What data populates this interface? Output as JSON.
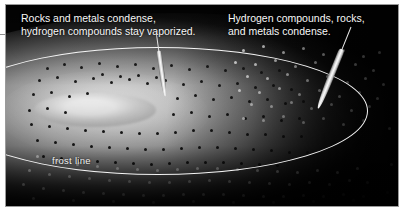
{
  "figure": {
    "type": "protoplanetary-disk-illustration",
    "background_color": "#050505",
    "frame_color": "#9a9a9a",
    "page_background": "#ffffff"
  },
  "annotations": {
    "left": {
      "text": "Rocks and metals condense,\nhydrogen compounds stay vaporized.",
      "color": "#f7f7f7",
      "pointer_target": "inner disk, inside frost line"
    },
    "right": {
      "text": "Hydrogen compounds, rocks,\nand metals condense.",
      "color": "#f7f7f7",
      "pointer_target": "outer disk, beyond frost line"
    }
  },
  "features": {
    "frost_line_label": "frost line",
    "frost_line_color": "#f4f4f4",
    "protosun_label": "protosun",
    "protosun_color": "#ffffff",
    "inner_particles": "dark rocky and metallic grains",
    "inner_particle_color": "#1b1b1b",
    "outer_particles": "bright icy condensate grains",
    "outer_particle_color": "#ffffff"
  },
  "chart_data": {
    "type": "scatter",
    "xlabel": "",
    "ylabel": "",
    "legend": [
      {
        "name": "Rocks and metals condense, hydrogen compounds stay vaporized.",
        "region": "inside frost line",
        "marker_color": "#1b1b1b"
      },
      {
        "name": "Hydrogen compounds, rocks, and metals condense.",
        "region": "outside frost line",
        "marker_color": "#ffffff"
      }
    ],
    "annotations": [
      "frost line"
    ],
    "grid": false
  },
  "particles": {
    "rock": [
      [
        40,
        62,
        3
      ],
      [
        57,
        58,
        3
      ],
      [
        74,
        61,
        3
      ],
      [
        92,
        57,
        3
      ],
      [
        110,
        60,
        3
      ],
      [
        128,
        58,
        3
      ],
      [
        146,
        62,
        3
      ],
      [
        164,
        59,
        3
      ],
      [
        182,
        63,
        3
      ],
      [
        200,
        60,
        3
      ],
      [
        218,
        64,
        3
      ],
      [
        236,
        62,
        3
      ],
      [
        254,
        66,
        3
      ],
      [
        272,
        64,
        3
      ],
      [
        32,
        74,
        3
      ],
      [
        50,
        71,
        3
      ],
      [
        68,
        75,
        3
      ],
      [
        86,
        72,
        3
      ],
      [
        104,
        76,
        3
      ],
      [
        122,
        73,
        3
      ],
      [
        140,
        77,
        3
      ],
      [
        158,
        74,
        3
      ],
      [
        176,
        78,
        3
      ],
      [
        194,
        75,
        3
      ],
      [
        212,
        79,
        3
      ],
      [
        230,
        77,
        3
      ],
      [
        248,
        81,
        3
      ],
      [
        266,
        79,
        3
      ],
      [
        284,
        83,
        3
      ],
      [
        26,
        88,
        3
      ],
      [
        44,
        86,
        3
      ],
      [
        62,
        90,
        3
      ],
      [
        80,
        87,
        3
      ],
      [
        170,
        92,
        3
      ],
      [
        188,
        89,
        3
      ],
      [
        206,
        93,
        3
      ],
      [
        224,
        91,
        3
      ],
      [
        242,
        95,
        3
      ],
      [
        260,
        93,
        3
      ],
      [
        278,
        97,
        3
      ],
      [
        296,
        95,
        3
      ],
      [
        22,
        104,
        3
      ],
      [
        40,
        102,
        3
      ],
      [
        58,
        106,
        3
      ],
      [
        166,
        108,
        3
      ],
      [
        184,
        106,
        3
      ],
      [
        202,
        110,
        3
      ],
      [
        220,
        108,
        3
      ],
      [
        238,
        112,
        3
      ],
      [
        256,
        110,
        3
      ],
      [
        274,
        114,
        3
      ],
      [
        292,
        112,
        3
      ],
      [
        24,
        118,
        3
      ],
      [
        42,
        120,
        3
      ],
      [
        60,
        122,
        3
      ],
      [
        78,
        124,
        3
      ],
      [
        96,
        125,
        3
      ],
      [
        114,
        126,
        3
      ],
      [
        132,
        127,
        3
      ],
      [
        150,
        127,
        3
      ],
      [
        168,
        126,
        3
      ],
      [
        186,
        124,
        3
      ],
      [
        204,
        124,
        3
      ],
      [
        222,
        126,
        3
      ],
      [
        240,
        128,
        3
      ],
      [
        258,
        128,
        3
      ],
      [
        276,
        130,
        3
      ],
      [
        294,
        130,
        3
      ],
      [
        30,
        134,
        3
      ],
      [
        48,
        136,
        3
      ],
      [
        66,
        138,
        3
      ],
      [
        84,
        140,
        3
      ],
      [
        102,
        141,
        3
      ],
      [
        120,
        142,
        3
      ],
      [
        138,
        143,
        3
      ],
      [
        156,
        143,
        3
      ],
      [
        174,
        142,
        3
      ],
      [
        192,
        141,
        3
      ],
      [
        210,
        141,
        3
      ],
      [
        228,
        142,
        3
      ],
      [
        246,
        143,
        3
      ],
      [
        264,
        144,
        3
      ],
      [
        282,
        146,
        3
      ],
      [
        300,
        146,
        3
      ],
      [
        36,
        150,
        3
      ],
      [
        54,
        152,
        3
      ],
      [
        72,
        154,
        3
      ],
      [
        90,
        155,
        3
      ],
      [
        108,
        156,
        3
      ],
      [
        126,
        157,
        3
      ],
      [
        144,
        158,
        3
      ],
      [
        162,
        157,
        3
      ],
      [
        180,
        156,
        3
      ],
      [
        198,
        156,
        3
      ],
      [
        216,
        156,
        3
      ],
      [
        234,
        157,
        3
      ],
      [
        252,
        158,
        3
      ],
      [
        270,
        159,
        3
      ],
      [
        95,
        68,
        3
      ],
      [
        113,
        70,
        3
      ],
      [
        131,
        69,
        3
      ],
      [
        149,
        71,
        3
      ]
    ],
    "ice": [
      [
        236,
        44,
        3
      ],
      [
        256,
        40,
        3
      ],
      [
        276,
        46,
        3
      ],
      [
        296,
        42,
        3
      ],
      [
        316,
        48,
        3
      ],
      [
        336,
        44,
        3
      ],
      [
        356,
        50,
        3
      ],
      [
        372,
        46,
        3
      ],
      [
        228,
        56,
        3
      ],
      [
        248,
        58,
        3
      ],
      [
        268,
        54,
        3
      ],
      [
        288,
        60,
        3
      ],
      [
        308,
        56,
        3
      ],
      [
        328,
        62,
        3
      ],
      [
        348,
        58,
        3
      ],
      [
        366,
        64,
        3
      ],
      [
        240,
        70,
        3
      ],
      [
        260,
        72,
        3
      ],
      [
        280,
        68,
        3
      ],
      [
        300,
        74,
        3
      ],
      [
        320,
        70,
        3
      ],
      [
        340,
        76,
        3
      ],
      [
        358,
        72,
        3
      ],
      [
        376,
        78,
        3
      ],
      [
        232,
        84,
        3
      ],
      [
        252,
        86,
        3
      ],
      [
        272,
        82,
        3
      ],
      [
        292,
        88,
        3
      ],
      [
        312,
        84,
        3
      ],
      [
        332,
        90,
        3
      ],
      [
        352,
        86,
        3
      ],
      [
        370,
        92,
        3
      ],
      [
        244,
        98,
        3
      ],
      [
        264,
        100,
        3
      ],
      [
        284,
        96,
        3
      ],
      [
        304,
        102,
        3
      ],
      [
        324,
        98,
        3
      ],
      [
        344,
        104,
        3
      ],
      [
        362,
        100,
        3
      ],
      [
        236,
        112,
        3
      ],
      [
        256,
        114,
        3
      ],
      [
        276,
        110,
        3
      ],
      [
        296,
        116,
        3
      ],
      [
        316,
        112,
        3
      ],
      [
        336,
        118,
        3
      ],
      [
        356,
        114,
        3
      ],
      [
        30,
        150,
        3
      ],
      [
        50,
        154,
        3
      ],
      [
        70,
        158,
        3
      ],
      [
        90,
        160,
        3
      ],
      [
        110,
        162,
        3
      ],
      [
        130,
        163,
        3
      ],
      [
        150,
        164,
        3
      ],
      [
        170,
        163,
        3
      ],
      [
        190,
        162,
        3
      ],
      [
        210,
        162,
        3
      ],
      [
        230,
        163,
        3
      ],
      [
        250,
        164,
        3
      ],
      [
        270,
        165,
        3
      ],
      [
        290,
        166,
        3
      ],
      [
        310,
        164,
        3
      ],
      [
        330,
        166,
        3
      ],
      [
        350,
        162,
        3
      ],
      [
        22,
        164,
        3
      ],
      [
        42,
        168,
        3
      ],
      [
        62,
        170,
        3
      ],
      [
        82,
        172,
        3
      ],
      [
        102,
        174,
        3
      ],
      [
        122,
        175,
        3
      ],
      [
        142,
        176,
        3
      ],
      [
        162,
        176,
        3
      ],
      [
        182,
        175,
        3
      ],
      [
        202,
        174,
        3
      ],
      [
        222,
        175,
        3
      ],
      [
        242,
        176,
        3
      ],
      [
        262,
        177,
        3
      ],
      [
        282,
        178,
        3
      ],
      [
        302,
        176,
        3
      ],
      [
        322,
        178,
        3
      ],
      [
        342,
        174,
        3
      ],
      [
        360,
        176,
        3
      ],
      [
        16,
        178,
        3
      ],
      [
        36,
        182,
        3
      ],
      [
        56,
        184,
        3
      ],
      [
        76,
        186,
        3
      ],
      [
        96,
        187,
        3
      ],
      [
        116,
        188,
        3
      ],
      [
        136,
        189,
        3
      ],
      [
        156,
        189,
        3
      ],
      [
        176,
        188,
        3
      ],
      [
        196,
        188,
        3
      ],
      [
        216,
        188,
        3
      ],
      [
        236,
        189,
        3
      ],
      [
        256,
        190,
        3
      ],
      [
        276,
        190,
        3
      ],
      [
        296,
        189,
        3
      ],
      [
        316,
        190,
        3
      ],
      [
        336,
        188,
        3
      ],
      [
        356,
        190,
        3
      ],
      [
        26,
        192,
        3
      ],
      [
        66,
        194,
        3
      ],
      [
        106,
        195,
        3
      ],
      [
        146,
        196,
        3
      ],
      [
        186,
        195,
        3
      ],
      [
        226,
        196,
        3
      ],
      [
        266,
        196,
        3
      ],
      [
        306,
        195,
        3
      ],
      [
        346,
        194,
        3
      ],
      [
        380,
        186,
        3
      ],
      [
        384,
        158,
        3
      ],
      [
        382,
        122,
        3
      ]
    ]
  }
}
